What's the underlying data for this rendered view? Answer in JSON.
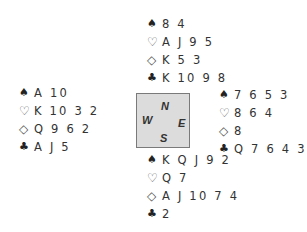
{
  "suit_icons": {
    "spades": "♠",
    "hearts": "♡",
    "diamonds": "◇",
    "clubs": "♣"
  },
  "hands": {
    "north": {
      "spades": "8 4",
      "hearts": "A J 9 5",
      "diamonds": "K 5 3",
      "clubs": "K 10 9 8"
    },
    "west": {
      "spades": "A 10",
      "hearts": "K 10 3 2",
      "diamonds": "Q 9 6 2",
      "clubs": "A J 5"
    },
    "east": {
      "spades": "7 6 5 3",
      "hearts": "8 6 4",
      "diamonds": "8",
      "clubs": "Q 7 6 4 3"
    },
    "south": {
      "spades": "K Q J 9 2",
      "hearts": "Q 7",
      "diamonds": "A J 10 7 4",
      "clubs": "2"
    }
  },
  "compass": {
    "north": "N",
    "west": "W",
    "east": "E",
    "south": "S"
  },
  "colors": {
    "compass_fill": "#dcdcdc",
    "compass_border": "#7a7a7a",
    "text": "#333333"
  }
}
